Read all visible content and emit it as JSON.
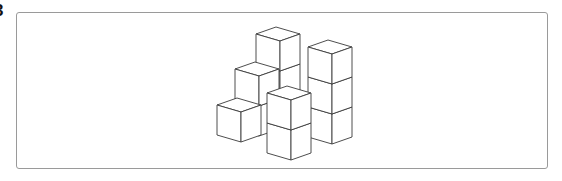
{
  "figure": {
    "label": "3"
  },
  "cubes": {
    "u": [
      24,
      7
    ],
    "v": [
      -20,
      7
    ],
    "h": 30,
    "stroke": "#3a3a3a",
    "items": [
      {
        "name": "back-top-cube",
        "tb": [
          276,
          27
        ],
        "stack": 1
      },
      {
        "name": "back-mid-cube",
        "tb": [
          276,
          57
        ],
        "stack": 1
      },
      {
        "name": "right-tower",
        "tb": [
          328,
          40
        ],
        "stack": 3
      },
      {
        "name": "middle-left-cube",
        "tb": [
          255,
          62
        ],
        "stack": 1
      },
      {
        "name": "middle-left-lower-cube",
        "tb": [
          255,
          92
        ],
        "stack": 1
      },
      {
        "name": "bottom-left-cube",
        "tb": [
          237,
          98
        ],
        "stack": 1
      },
      {
        "name": "front-stack",
        "tb": [
          287,
          86
        ],
        "stack": 2
      }
    ]
  }
}
